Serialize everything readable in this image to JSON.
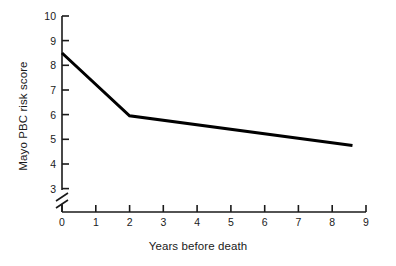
{
  "chart_data": {
    "type": "line",
    "title": "",
    "subtitle": "",
    "xlabel": "Years before death",
    "ylabel": "Mayo PBC risk score",
    "xlim": [
      0,
      9
    ],
    "ylim": [
      3,
      10
    ],
    "xticks": [
      0,
      1,
      2,
      3,
      4,
      5,
      6,
      7,
      8,
      9
    ],
    "xtick_labels": [
      "0",
      "1",
      "2",
      "3",
      "4",
      "5",
      "6",
      "7",
      "8",
      "9"
    ],
    "yticks": [
      3,
      4,
      5,
      6,
      7,
      8,
      9,
      10
    ],
    "ytick_labels": [
      "3",
      "4",
      "5",
      "6",
      "7",
      "8",
      "9",
      "10"
    ],
    "y_axis_break": true,
    "y_axis_break_note": "axis broken below 3",
    "grid": false,
    "legend": null,
    "series": [
      {
        "name": "Mayo PBC risk score",
        "color": "#000000",
        "line_width": 3,
        "x": [
          0,
          2,
          8.6
        ],
        "y": [
          8.5,
          5.95,
          4.75
        ]
      }
    ],
    "annotations": []
  }
}
